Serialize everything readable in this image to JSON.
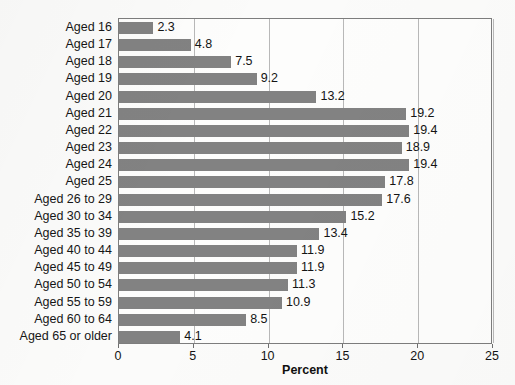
{
  "chart_data": {
    "type": "bar",
    "orientation": "horizontal",
    "title": "",
    "xlabel": "Percent",
    "ylabel": "",
    "xlim": [
      0,
      25
    ],
    "xticks": [
      "0",
      "5",
      "10",
      "15",
      "20",
      "25"
    ],
    "grid": "vertical gridlines at every x tick",
    "legend": "none",
    "bar_color": "#828282",
    "categories": [
      "Aged 16",
      "Aged 17",
      "Aged 18",
      "Aged 19",
      "Aged 20",
      "Aged 21",
      "Aged 22",
      "Aged 23",
      "Aged 24",
      "Aged 25",
      "Aged 26 to 29",
      "Aged 30 to 34",
      "Aged 35 to 39",
      "Aged 40 to 44",
      "Aged 45 to 49",
      "Aged 50 to 54",
      "Aged 55 to 59",
      "Aged 60 to 64",
      "Aged 65 or older"
    ],
    "values": [
      2.3,
      4.8,
      7.5,
      9.2,
      13.2,
      19.2,
      19.4,
      18.9,
      19.4,
      17.8,
      17.6,
      15.2,
      13.4,
      11.9,
      11.9,
      11.3,
      10.9,
      8.5,
      4.1
    ],
    "data_labels": [
      "2.3",
      "4.8",
      "7.5",
      "9.2",
      "13.2",
      "19.2",
      "19.4",
      "18.9",
      "19.4",
      "17.8",
      "17.6",
      "15.2",
      "13.4",
      "11.9",
      "11.9",
      "11.3",
      "10.9",
      "8.5",
      "4.1"
    ]
  }
}
